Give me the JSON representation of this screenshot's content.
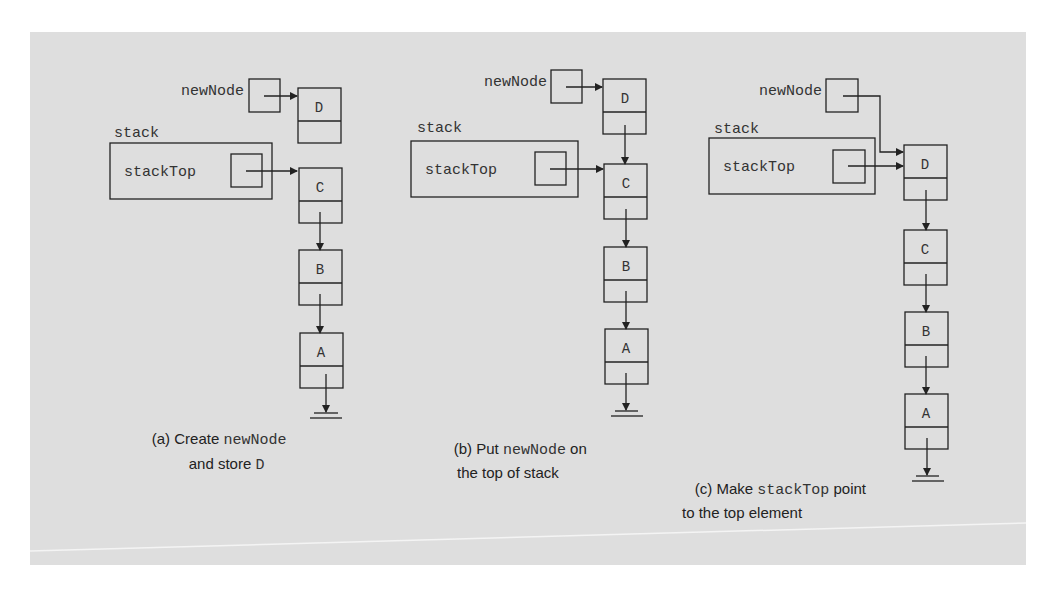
{
  "figure": {
    "background_color": "#dedede",
    "line_color": "#222222",
    "panels": [
      {
        "id": "a",
        "new_node_label": "newNode",
        "stack_label": "stack",
        "stack_top_label": "stackTop",
        "nodes": [
          "D",
          "C",
          "B",
          "A"
        ],
        "caption_prefix": "(a) Create ",
        "caption_code": "newNode",
        "caption_line2_text": "and store ",
        "caption_line2_code": "D"
      },
      {
        "id": "b",
        "new_node_label": "newNode",
        "stack_label": "stack",
        "stack_top_label": "stackTop",
        "nodes": [
          "D",
          "C",
          "B",
          "A"
        ],
        "caption_prefix": "(b) Put ",
        "caption_code": "newNode",
        "caption_suffix": " on",
        "caption_line2_text": "the top of stack"
      },
      {
        "id": "c",
        "new_node_label": "newNode",
        "stack_label": "stack",
        "stack_top_label": "stackTop",
        "nodes": [
          "D",
          "C",
          "B",
          "A"
        ],
        "caption_prefix": "(c) Make ",
        "caption_code": "stackTop",
        "caption_suffix": " point",
        "caption_line2_text": "to the top element"
      }
    ]
  }
}
